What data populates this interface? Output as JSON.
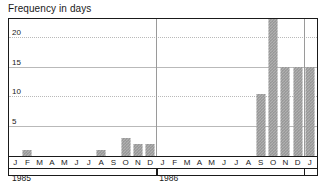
{
  "chart_data": {
    "type": "bar",
    "title": "Frequency in days",
    "xlabel": "",
    "ylabel": "",
    "ylim": [
      0,
      23
    ],
    "yticks": [
      5,
      10,
      15,
      20
    ],
    "ytick_labels": [
      "5",
      "10",
      "15",
      "20"
    ],
    "grid": true,
    "legend": "none",
    "categories": [
      "J",
      "F",
      "M",
      "A",
      "M",
      "J",
      "J",
      "A",
      "S",
      "O",
      "N",
      "D",
      "J",
      "F",
      "M",
      "A",
      "M",
      "J",
      "J",
      "A",
      "S",
      "O",
      "N",
      "D",
      "J"
    ],
    "values": [
      0,
      1,
      0,
      0,
      0,
      0,
      0,
      1,
      0,
      3,
      2,
      2,
      0,
      0,
      0,
      0,
      0,
      0,
      0,
      0,
      10.5,
      23,
      15,
      15,
      15
    ],
    "annotations": [
      "October 1986 bar extends beyond the top of the plot area (off scale)"
    ],
    "period_labels": [
      "1985",
      "1986"
    ]
  },
  "colors": {
    "bar_fill": "#b0b0b0",
    "bar_hatch": "#8e8e8e",
    "frame": "#1a1a1a",
    "gridline": "#b9b9b9",
    "background": "#ffffff",
    "text": "#1a1a1a"
  }
}
